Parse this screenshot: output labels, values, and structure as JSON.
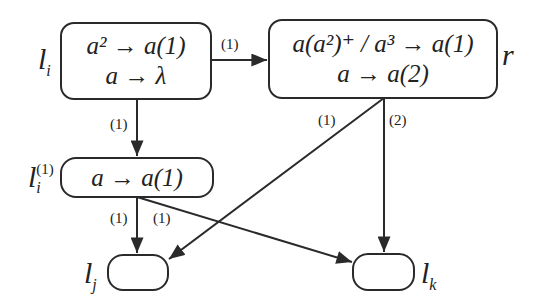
{
  "diagram": {
    "nodes": {
      "li": {
        "label_main": "l",
        "label_sub": "i",
        "rules": [
          "a² → a(1)",
          "a → λ"
        ]
      },
      "r": {
        "label_main": "r",
        "rules": [
          "a(a²)⁺ / a³ → a(1)",
          "a → a(2)"
        ]
      },
      "li1": {
        "label_main": "l",
        "label_sub": "i",
        "label_sup": "(1)",
        "rules": [
          "a → a(1)"
        ]
      },
      "lj": {
        "label_main": "l",
        "label_sub": "j",
        "rules": []
      },
      "lk": {
        "label_main": "l",
        "label_sub": "k",
        "rules": []
      }
    },
    "edges": [
      {
        "from": "li",
        "to": "r",
        "label": "(1)"
      },
      {
        "from": "li",
        "to": "li1",
        "label": "(1)"
      },
      {
        "from": "r",
        "to": "lj",
        "label": "(1)"
      },
      {
        "from": "r",
        "to": "lk",
        "label": "(2)"
      },
      {
        "from": "li1",
        "to": "lj",
        "label": "(1)"
      },
      {
        "from": "li1",
        "to": "lk",
        "label": "(1)"
      }
    ],
    "colors": {
      "stroke": "#2a2a2a",
      "background": "#ffffff"
    }
  }
}
